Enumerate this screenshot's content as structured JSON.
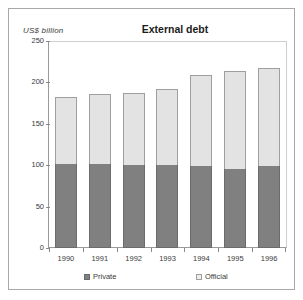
{
  "figure": {
    "background_color": "#ffffff",
    "frame_color": "#a8a8a8"
  },
  "chart_data": {
    "type": "bar",
    "subtype": "stacked-vertical",
    "title": "External debt",
    "xlabel": "",
    "ylabel": "US$ billion",
    "ylim": [
      0,
      250
    ],
    "yticks": [
      0,
      50,
      100,
      150,
      200,
      250
    ],
    "ytick_labels": [
      "0",
      "50",
      "100",
      "150",
      "200",
      "250"
    ],
    "grid": false,
    "legend_position": "bottom",
    "categories": [
      "1990",
      "1991",
      "1992",
      "1993",
      "1994",
      "1995",
      "1996"
    ],
    "series": [
      {
        "name": "Private",
        "color": "#808080",
        "values": [
          101,
          101,
          100,
          100,
          99,
          95,
          99
        ]
      },
      {
        "name": "Official",
        "color": "#e3e3e3",
        "values": [
          81,
          85,
          87,
          92,
          110,
          119,
          119
        ]
      }
    ],
    "totals": [
      182,
      186,
      187,
      192,
      209,
      214,
      218
    ]
  },
  "legend": {
    "entries": [
      {
        "label": "Private",
        "swatch": "private"
      },
      {
        "label": "Official",
        "swatch": "official"
      }
    ]
  }
}
